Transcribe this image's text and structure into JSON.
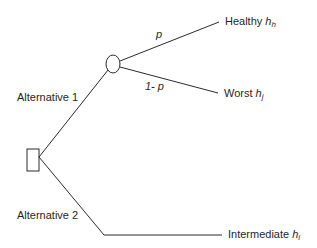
{
  "diagram": {
    "type": "decision-tree",
    "colors": {
      "line": "#2a2a2a",
      "text": "#1f1f1f",
      "background": "#ffffff"
    },
    "nodes": {
      "decision": {
        "shape": "rectangle",
        "label": ""
      },
      "chance": {
        "shape": "circle",
        "label": ""
      }
    },
    "branches": {
      "alt1": {
        "label": "Alternative 1"
      },
      "alt2": {
        "label": "Alternative 2"
      },
      "prob_up": {
        "label": "p"
      },
      "prob_down": {
        "label": "1- p"
      }
    },
    "outcomes": [
      {
        "name": "Healthy",
        "symbol": "h",
        "subscript": "h"
      },
      {
        "name": "Worst",
        "symbol": "h",
        "subscript": "j"
      },
      {
        "name": "Intermediate",
        "symbol": "h",
        "subscript": "i"
      }
    ]
  }
}
